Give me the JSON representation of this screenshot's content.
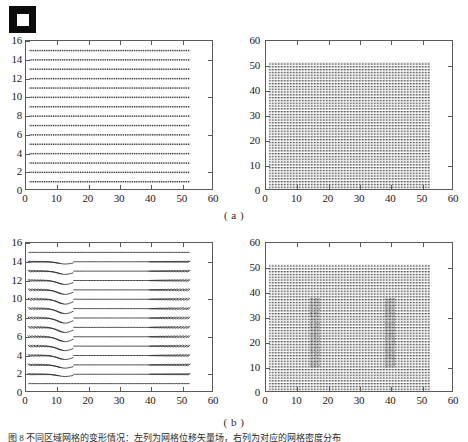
{
  "figure": {
    "marker_icon": "filled-square-marker",
    "subcaptions": [
      "( a )",
      "( b )"
    ],
    "caption": "图 8   不同区域网格的变形情况：左列为网格位移矢量场，右列为对应的网格密度分布"
  },
  "chart_data": [
    {
      "id": "panel-a-left",
      "type": "scatter",
      "title": "",
      "xlabel": "",
      "ylabel": "",
      "xlim": [
        0,
        60
      ],
      "ylim": [
        0,
        16
      ],
      "xticks": [
        0,
        10,
        20,
        30,
        40,
        50,
        60
      ],
      "yticks": [
        0,
        2,
        4,
        6,
        8,
        10,
        12,
        14,
        16
      ],
      "grid": false,
      "description": "Undeformed mesh: 15 horizontal rows of dense dotted markers spanning x=1..52, rows at y=1..15 step 1",
      "rows_y": [
        1,
        2,
        3,
        4,
        5,
        6,
        7,
        8,
        9,
        10,
        11,
        12,
        13,
        14,
        15
      ],
      "x_range": [
        1,
        52
      ],
      "points_per_row": 104,
      "marker_color": "#3a3a3a"
    },
    {
      "id": "panel-a-right",
      "type": "heatmap",
      "title": "",
      "xlabel": "",
      "ylabel": "",
      "xlim": [
        0,
        60
      ],
      "ylim": [
        0,
        60
      ],
      "xticks": [
        0,
        10,
        20,
        30,
        40,
        50,
        60
      ],
      "yticks": [
        0,
        10,
        20,
        30,
        40,
        50,
        60
      ],
      "grid": false,
      "description": "Uniform dense dotted grid block spanning x=1..52, y=0..51.5 with uniform density",
      "block_x": [
        1,
        52
      ],
      "block_y": [
        0,
        51.5
      ],
      "rows": 52,
      "uniform": true,
      "marker_color": "#4a4a4a"
    },
    {
      "id": "panel-b-left",
      "type": "scatter",
      "title": "",
      "xlabel": "",
      "ylabel": "",
      "xlim": [
        0,
        60
      ],
      "ylim": [
        0,
        16
      ],
      "xticks": [
        0,
        10,
        20,
        30,
        40,
        50,
        60
      ],
      "yticks": [
        0,
        2,
        4,
        6,
        8,
        10,
        12,
        14,
        16
      ],
      "grid": false,
      "description": "Deformed mesh: 15 rows of dotted markers, strongly sheared/slanted for x<13 and x>39, flat in middle band 15<x<38; rows 1 and 15 nearly undeformed",
      "rows_y": [
        1,
        2,
        3,
        4,
        5,
        6,
        7,
        8,
        9,
        10,
        11,
        12,
        13,
        14,
        15
      ],
      "x_range": [
        1,
        52
      ],
      "points_per_row": 104,
      "deformation_zones": [
        [
          1,
          13
        ],
        [
          39,
          52
        ]
      ],
      "flat_zone": [
        15,
        38
      ],
      "marker_color": "#3a3a3a"
    },
    {
      "id": "panel-b-right",
      "type": "heatmap",
      "title": "",
      "xlabel": "",
      "ylabel": "",
      "xlim": [
        0,
        60
      ],
      "ylim": [
        0,
        60
      ],
      "xticks": [
        0,
        10,
        20,
        30,
        40,
        50,
        60
      ],
      "yticks": [
        0,
        10,
        20,
        30,
        40,
        50,
        60
      ],
      "grid": false,
      "description": "Dense dotted grid block x=1..52, y=0..51.5 with two darker vertical disturbance bands near x=14-17 and x=38-41, concentrated for y=10..38",
      "block_x": [
        1,
        52
      ],
      "block_y": [
        0,
        51.5
      ],
      "rows": 52,
      "uniform": false,
      "dark_bands_x": [
        [
          14,
          17
        ],
        [
          38,
          41
        ]
      ],
      "dark_bands_y": [
        10,
        38
      ],
      "marker_color": "#4a4a4a"
    }
  ]
}
